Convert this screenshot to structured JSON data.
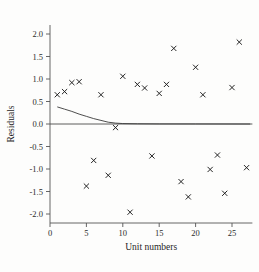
{
  "chart_data": {
    "type": "scatter",
    "title": "",
    "xlabel": "Unit numbers",
    "ylabel": "Residuals",
    "xlim": [
      0,
      27.8
    ],
    "ylim": [
      -2.2,
      2.2
    ],
    "grid": false,
    "legend": "none",
    "marker": "x",
    "x_ticks": [
      0,
      5,
      10,
      15,
      20,
      25
    ],
    "x_tick_labels": [
      "0",
      "5",
      "10",
      "15",
      "20",
      "25"
    ],
    "y_ticks": [
      2.0,
      1.5,
      1.0,
      0.5,
      0.0,
      -0.5,
      -1.0,
      -1.5,
      -2.0
    ],
    "y_tick_labels": [
      "2.0",
      "1.5",
      "1.0",
      "0.5",
      "0.0",
      "-0.5",
      "-1.0",
      "-1.5",
      "-2.0"
    ],
    "x": [
      1,
      2,
      3,
      4,
      5,
      6,
      7,
      8,
      9,
      10,
      11,
      12,
      13,
      14,
      15,
      16,
      17,
      18,
      19,
      20,
      21,
      22,
      23,
      24,
      25,
      26,
      27
    ],
    "y": [
      0.65,
      0.72,
      0.92,
      0.94,
      -1.38,
      -0.81,
      0.65,
      -1.14,
      -0.08,
      1.06,
      -1.96,
      0.88,
      0.8,
      -0.71,
      0.68,
      0.88,
      1.68,
      -1.28,
      -1.62,
      1.26,
      0.65,
      -1.01,
      -0.69,
      -1.54,
      0.81,
      1.82,
      -0.97
    ],
    "series": [
      {
        "name": "residuals",
        "marker": "x",
        "points": [
          {
            "x": 1,
            "y": 0.65
          },
          {
            "x": 2,
            "y": 0.72
          },
          {
            "x": 3,
            "y": 0.92
          },
          {
            "x": 4,
            "y": 0.94
          },
          {
            "x": 5,
            "y": -1.38
          },
          {
            "x": 6,
            "y": -0.81
          },
          {
            "x": 7,
            "y": 0.65
          },
          {
            "x": 8,
            "y": -1.14
          },
          {
            "x": 9,
            "y": -0.08
          },
          {
            "x": 10,
            "y": 1.06
          },
          {
            "x": 11,
            "y": -1.96
          },
          {
            "x": 12,
            "y": 0.88
          },
          {
            "x": 13,
            "y": 0.8
          },
          {
            "x": 14,
            "y": -0.71
          },
          {
            "x": 15,
            "y": 0.68
          },
          {
            "x": 16,
            "y": 0.88
          },
          {
            "x": 17,
            "y": 1.68
          },
          {
            "x": 18,
            "y": -1.28
          },
          {
            "x": 19,
            "y": -1.62
          },
          {
            "x": 20,
            "y": 1.26
          },
          {
            "x": 21,
            "y": 0.65
          },
          {
            "x": 22,
            "y": -1.01
          },
          {
            "x": 23,
            "y": -0.69
          },
          {
            "x": 24,
            "y": -1.54
          },
          {
            "x": 25,
            "y": 0.81
          },
          {
            "x": 26,
            "y": 1.82
          },
          {
            "x": 27,
            "y": -0.97
          }
        ]
      }
    ],
    "reference_lines": [
      {
        "name": "zero-line",
        "type": "horizontal",
        "y": 0.0
      },
      {
        "name": "fitted-decay-curve",
        "type": "curve",
        "description": "decaying curve from y=0.38 at x=1 approaching y=0",
        "points": [
          {
            "x": 1.0,
            "y": 0.38
          },
          {
            "x": 2.0,
            "y": 0.33
          },
          {
            "x": 3.0,
            "y": 0.28
          },
          {
            "x": 4.0,
            "y": 0.22
          },
          {
            "x": 5.0,
            "y": 0.17
          },
          {
            "x": 6.0,
            "y": 0.12
          },
          {
            "x": 7.0,
            "y": 0.08
          },
          {
            "x": 8.0,
            "y": 0.04
          },
          {
            "x": 9.0,
            "y": 0.02
          },
          {
            "x": 10.0,
            "y": 0.01
          },
          {
            "x": 12.0,
            "y": 0.005
          },
          {
            "x": 15.0,
            "y": 0.002
          },
          {
            "x": 20.0,
            "y": 0.001
          },
          {
            "x": 27.5,
            "y": 0.0
          }
        ]
      }
    ]
  }
}
